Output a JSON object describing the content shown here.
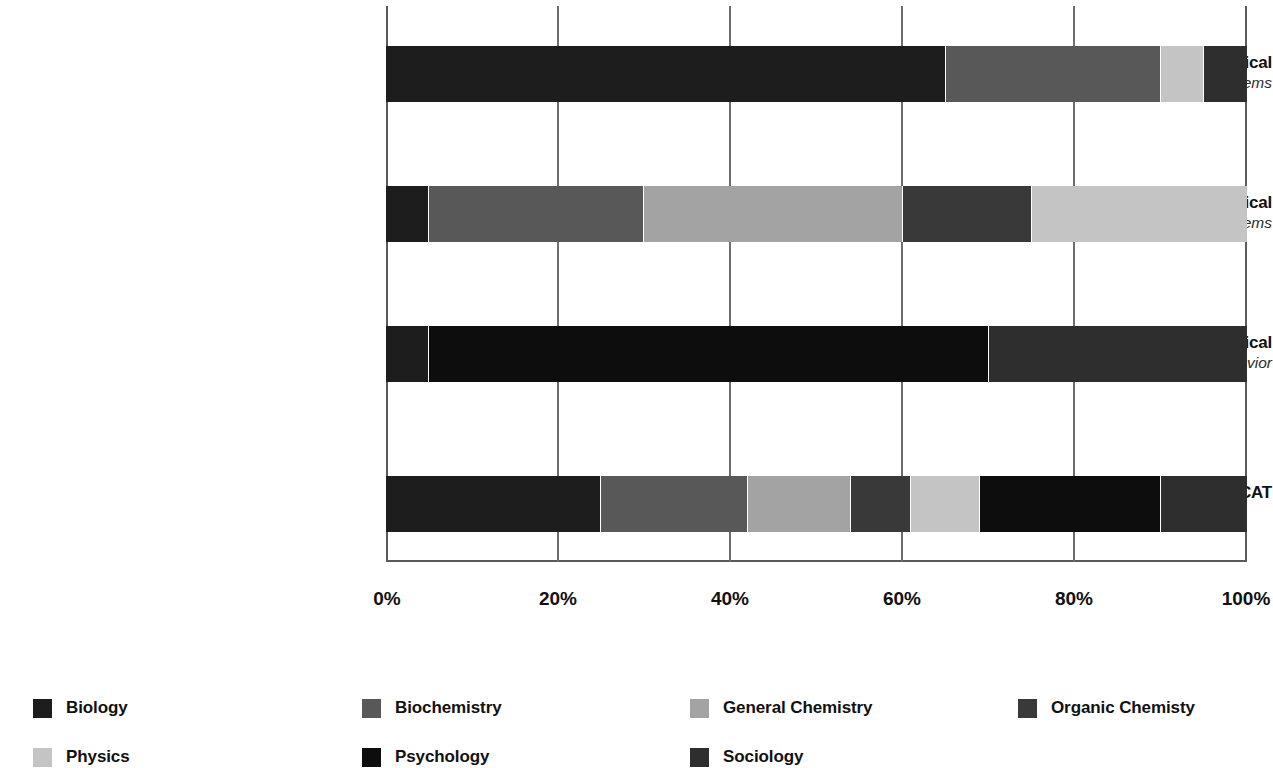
{
  "chart_data": {
    "type": "bar",
    "subtype": "stacked-horizontal-100-percent",
    "title": "",
    "xlabel": "",
    "ylabel": "",
    "xlim": [
      0,
      100
    ],
    "xticks": [
      "0%",
      "20%",
      "40%",
      "60%",
      "80%",
      "100%"
    ],
    "xtick_values": [
      0,
      20,
      40,
      60,
      80,
      100
    ],
    "grid": true,
    "legend_position": "bottom",
    "categories": [
      {
        "label": "Biological and Biochemical",
        "sublabel": "Foundations of Living Systems"
      },
      {
        "label": "Chemical and Physical",
        "sublabel": "Foundations of Biological Systems"
      },
      {
        "label": "Psychological, Social, and Biological",
        "sublabel": "Foundations of Behavior"
      },
      {
        "label": "MCAT",
        "sublabel": ""
      }
    ],
    "series": [
      {
        "name": "Biology",
        "color": "#1d1d1d",
        "values": [
          65,
          5,
          5,
          25
        ]
      },
      {
        "name": "Biochemistry",
        "color": "#585858",
        "values": [
          25,
          25,
          0,
          17
        ]
      },
      {
        "name": "General Chemistry",
        "color": "#a3a3a3",
        "values": [
          0,
          30,
          0,
          12
        ]
      },
      {
        "name": "Organic Chemisty",
        "color": "#393939",
        "values": [
          0,
          15,
          0,
          7
        ]
      },
      {
        "name": "Physics",
        "color": "#c4c4c4",
        "values": [
          5,
          25,
          0,
          8
        ]
      },
      {
        "name": "Psychology",
        "color": "#0d0d0d",
        "values": [
          0,
          0,
          65,
          21
        ]
      },
      {
        "name": "Sociology",
        "color": "#2e2e2e",
        "values": [
          5,
          0,
          30,
          10
        ]
      }
    ]
  },
  "legend": {
    "items": [
      {
        "label": "Biology",
        "color": "#1d1d1d"
      },
      {
        "label": "Biochemistry",
        "color": "#585858"
      },
      {
        "label": "General Chemistry",
        "color": "#a3a3a3"
      },
      {
        "label": "Organic Chemisty",
        "color": "#393939"
      },
      {
        "label": "Physics",
        "color": "#c4c4c4"
      },
      {
        "label": "Psychology",
        "color": "#0d0d0d"
      },
      {
        "label": "Sociology",
        "color": "#2e2e2e"
      }
    ]
  },
  "axis": {
    "tick_labels": [
      "0%",
      "20%",
      "40%",
      "60%",
      "80%",
      "100%"
    ]
  }
}
